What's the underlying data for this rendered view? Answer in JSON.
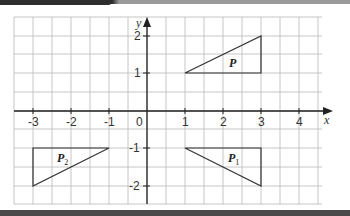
{
  "diagram": {
    "type": "coordinate-grid-transformations",
    "axes": {
      "x_label": "x",
      "y_label": "y",
      "x_ticks": [
        "-3",
        "-2",
        "-1",
        "0",
        "1",
        "2",
        "3",
        "4"
      ],
      "y_ticks": [
        "2",
        "1",
        "-1",
        "-2"
      ],
      "origin_label": "0",
      "x_range": [
        -3.5,
        4.6
      ],
      "y_range": [
        -2.5,
        2.5
      ],
      "grid_step": 0.5
    },
    "shapes": [
      {
        "name": "P",
        "label": "P",
        "subscript": "",
        "vertices": [
          [
            1,
            1
          ],
          [
            3,
            2
          ],
          [
            3,
            1
          ]
        ]
      },
      {
        "name": "P1",
        "label": "P",
        "subscript": "1",
        "vertices": [
          [
            1,
            -1
          ],
          [
            3,
            -2
          ],
          [
            3,
            -1
          ]
        ]
      },
      {
        "name": "P2",
        "label": "P",
        "subscript": "2",
        "vertices": [
          [
            -3,
            -1
          ],
          [
            -3,
            -2
          ],
          [
            -1,
            -1
          ]
        ]
      }
    ],
    "colors": {
      "grid": "#b8b8b8",
      "axis": "#222222",
      "shape": "#333333",
      "text": "#333333"
    }
  }
}
